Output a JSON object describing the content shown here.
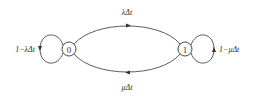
{
  "diagram": {
    "type": "state-transition",
    "nodes": [
      {
        "id": "0",
        "label": "0"
      },
      {
        "id": "1",
        "label": "1"
      }
    ],
    "edges": [
      {
        "from": "0",
        "to": "1",
        "label": "λΔt"
      },
      {
        "from": "1",
        "to": "0",
        "label": "μΔt"
      },
      {
        "from": "0",
        "to": "0",
        "label": "1−λΔt"
      },
      {
        "from": "1",
        "to": "1",
        "label": "1−μΔt"
      }
    ],
    "colors": {
      "stroke": "#333333",
      "background": "#ffffff"
    }
  }
}
